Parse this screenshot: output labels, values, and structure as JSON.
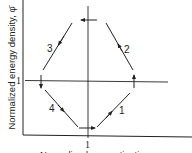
{
  "diagram": {
    "y_axis_label": "Normalized energy density, φ̄",
    "x_axis_label": "Normalized magnetization, m",
    "y_tick": "1",
    "x_tick": "1",
    "segments": [
      {
        "id": "1",
        "label": "1",
        "direction": "up-right"
      },
      {
        "id": "2",
        "label": "2",
        "direction": "up-left"
      },
      {
        "id": "3",
        "label": "3",
        "direction": "down-left"
      },
      {
        "id": "4",
        "label": "4",
        "direction": "down-right"
      }
    ],
    "line_color": "#222222"
  }
}
